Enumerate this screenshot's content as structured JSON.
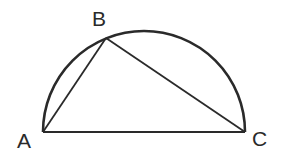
{
  "diagram": {
    "type": "semicircle-inscribed-triangle",
    "labels": {
      "A": "A",
      "B": "B",
      "C": "C"
    },
    "points": {
      "A": [
        43,
        132
      ],
      "B": [
        106,
        38
      ],
      "C": [
        245,
        132
      ]
    },
    "segments": [
      "AB",
      "BC",
      "AC"
    ],
    "arc": "semicircle over diameter AC",
    "colors": {
      "stroke": "#2a2a2a",
      "background": "#ffffff"
    }
  }
}
